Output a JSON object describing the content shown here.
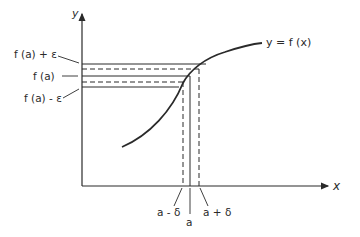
{
  "figure": {
    "y_axis_label": "y",
    "x_axis_label": "x",
    "curve_label": "y = f (x)",
    "y_labels": {
      "upper": "f (a) + ε",
      "center": "f (a)",
      "lower": "f (a) - ε"
    },
    "x_labels": {
      "left": "a - δ",
      "center": "a",
      "right": "a + δ"
    },
    "colors": {
      "line": "#2a2a2a",
      "background": "#ffffff"
    }
  }
}
